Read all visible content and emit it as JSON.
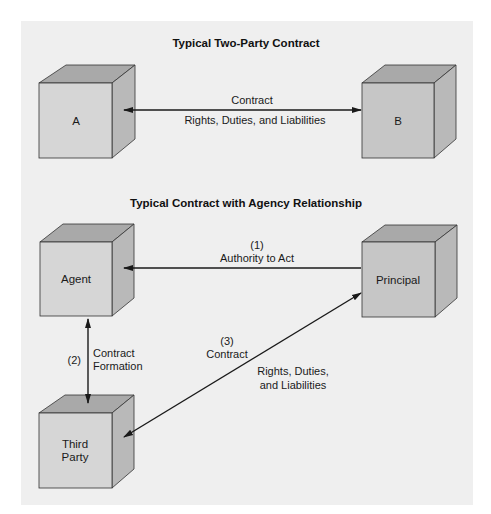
{
  "diagram": {
    "section1": {
      "title": "Typical Two-Party Contract",
      "party_a": "A",
      "party_b": "B",
      "arrow_label_top": "Contract",
      "arrow_label_bottom": "Rights, Duties, and Liabilities"
    },
    "section2": {
      "title": "Typical Contract with Agency Relationship",
      "agent": "Agent",
      "principal": "Principal",
      "third_party_line1": "Third",
      "third_party_line2": "Party",
      "authority": {
        "number": "(1)",
        "label": "Authority to Act"
      },
      "formation": {
        "number": "(2)",
        "label_line1": "Contract",
        "label_line2": "Formation"
      },
      "contract": {
        "number": "(3)",
        "label": "Contract"
      },
      "rights_line1": "Rights, Duties,",
      "rights_line2": "and Liabilities"
    },
    "colors": {
      "background": "#efefef",
      "cube_front_light": "#d6d6d6",
      "cube_front_dark": "#c6c6c6",
      "cube_top": "#a9a9a9",
      "cube_side": "#b9b9b9",
      "line": "#1a1a1a"
    }
  }
}
